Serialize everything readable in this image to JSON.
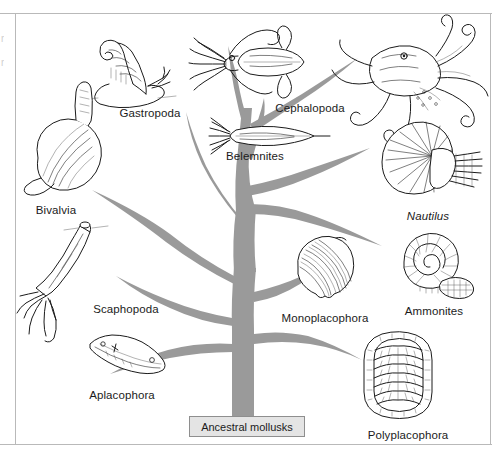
{
  "figure": {
    "background_color": "#ffffff",
    "branch_color": "#9a9a9a",
    "ink_color": "#1b1b1b",
    "frame": {
      "top_rule": true,
      "bottom_rule": true,
      "left_rule": true,
      "right_rule": true,
      "rule_color": "#b9b9b9"
    }
  },
  "root": {
    "label": "Ancestral mollusks",
    "box_fill": "#e4e4e4",
    "box_border": "#8e8e8e"
  },
  "taxa": [
    {
      "id": "gastropoda",
      "label": "Gastropoda",
      "icon": "snail-icon",
      "label_x": 150,
      "label_y": 108,
      "italic": false
    },
    {
      "id": "bivalvia",
      "label": "Bivalvia",
      "icon": "clam-icon",
      "label_x": 56,
      "label_y": 205,
      "italic": false
    },
    {
      "id": "scaphopoda",
      "label": "Scaphopoda",
      "icon": "tusk-shell-icon",
      "label_x": 126,
      "label_y": 304,
      "italic": false
    },
    {
      "id": "aplacophora",
      "label": "Aplacophora",
      "icon": "worm-mollusk-icon",
      "label_x": 122,
      "label_y": 390,
      "italic": false
    },
    {
      "id": "cephalopoda",
      "label": "Cephalopoda",
      "icon": "squid-icon",
      "label_x": 310,
      "label_y": 103,
      "italic": false
    },
    {
      "id": "belemnites",
      "label": "Belemnites",
      "icon": "belemnite-icon",
      "label_x": 255,
      "label_y": 151,
      "italic": false
    },
    {
      "id": "nautilus",
      "label": "Nautilus",
      "icon": "nautilus-shell-icon",
      "label_x": 428,
      "label_y": 211,
      "italic": true
    },
    {
      "id": "ammonites",
      "label": "Ammonites",
      "icon": "ammonite-spiral-icon",
      "label_x": 434,
      "label_y": 306,
      "italic": false
    },
    {
      "id": "monoplacophora",
      "label": "Monoplacophora",
      "icon": "cap-shell-icon",
      "label_x": 325,
      "label_y": 313,
      "italic": false
    },
    {
      "id": "polyplacophora",
      "label": "Polyplacophora",
      "icon": "chiton-icon",
      "label_x": 408,
      "label_y": 430,
      "italic": false
    }
  ],
  "edge_fragments": [
    {
      "text": "r",
      "x": 1,
      "y": 38
    },
    {
      "text": "r",
      "x": 1,
      "y": 62
    }
  ]
}
